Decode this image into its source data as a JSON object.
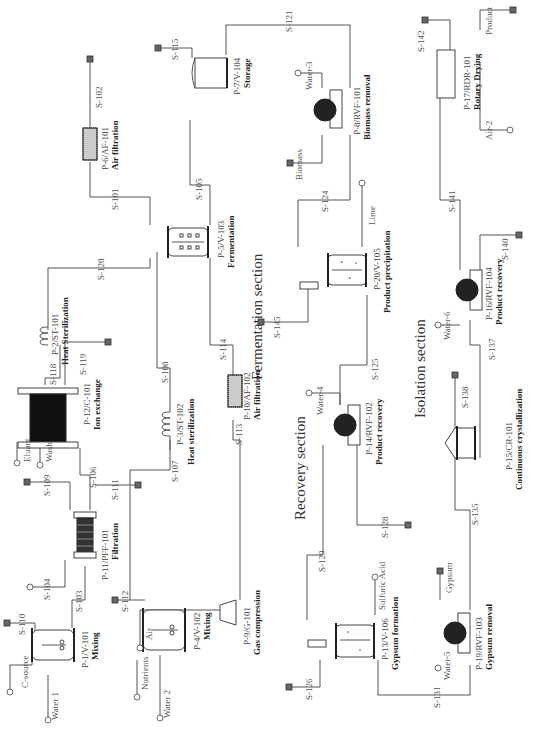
{
  "diagram": {
    "orientation": "rotated 90° clockwise",
    "sections": [
      {
        "id": "fermentation",
        "label": "Fermentation section"
      },
      {
        "id": "recovery",
        "label": "Recovery section"
      },
      {
        "id": "isolation",
        "label": "Isolation section"
      }
    ],
    "equipment": [
      {
        "id": "P-1/V-101",
        "name": "Mixing",
        "type": "mixing-tank"
      },
      {
        "id": "P-4/V-102",
        "name": "Mixing",
        "type": "mixing-tank"
      },
      {
        "id": "P-11/PFF-101",
        "name": "Filtration",
        "type": "plate-frame-filter"
      },
      {
        "id": "P-3/ST-102",
        "name": "Heat sterilization",
        "type": "heat-sterilizer"
      },
      {
        "id": "P-12/C-101",
        "name": "Ion exchange",
        "type": "ion-exchange-column"
      },
      {
        "id": "P-2/ST-101",
        "name": "Heat Sterilization",
        "type": "heat-sterilizer"
      },
      {
        "id": "P-6/AF-101",
        "name": "Air filtration",
        "type": "air-filter"
      },
      {
        "id": "P-10/AF-102",
        "name": "Air filtration",
        "type": "air-filter"
      },
      {
        "id": "P-9/G-101",
        "name": "Gas compression",
        "type": "compressor"
      },
      {
        "id": "P-5/V-103",
        "name": "Fermentation",
        "type": "fermenter"
      },
      {
        "id": "P-7/V-104",
        "name": "Storage",
        "type": "storage-tank"
      },
      {
        "id": "P-8/RVF-101",
        "name": "Biomass removal",
        "type": "rotary-vacuum-filter"
      },
      {
        "id": "P-20/V-105",
        "name": "Product precipitation",
        "type": "precipitation-tank"
      },
      {
        "id": "P-14/RVF-102",
        "name": "Product recovery",
        "type": "rotary-vacuum-filter"
      },
      {
        "id": "P-13/V-106",
        "name": "Gypsum formation",
        "type": "reactor-tank"
      },
      {
        "id": "P-19/RVF-103",
        "name": "Gypsum removal",
        "type": "rotary-vacuum-filter"
      },
      {
        "id": "P-15/CR-101",
        "name": "Continuous crystallization",
        "type": "crystallizer"
      },
      {
        "id": "P-16/RVF-104",
        "name": "Product recovery",
        "type": "rotary-vacuum-filter"
      },
      {
        "id": "P-17/RDR-101",
        "name": "Rotary Drying",
        "type": "rotary-dryer"
      }
    ],
    "streams": {
      "inputs": [
        "C-source",
        "Water 1",
        "Nutrients",
        "Water 2",
        "Air",
        "Eluant",
        "Wash",
        "Water-3",
        "Lime",
        "Water-4",
        "Sulfuric Acid",
        "Water-5",
        "Water-6",
        "Air-2"
      ],
      "outputs": [
        "Biomass",
        "Gypsum",
        "Product"
      ],
      "labels": [
        "S-101",
        "S-102",
        "S-103",
        "S-104",
        "S-105",
        "S-106",
        "S-107",
        "S-108",
        "S-109",
        "S-110",
        "S-111",
        "S-112",
        "S-113",
        "S-114",
        "S-115",
        "S-118",
        "S-119",
        "S-120",
        "S-121",
        "S-124",
        "S-125",
        "S-126",
        "S-128",
        "S-129",
        "S-131",
        "S-135",
        "S-137",
        "S-138",
        "S-140",
        "S-141",
        "S-142",
        "S-145"
      ]
    }
  }
}
